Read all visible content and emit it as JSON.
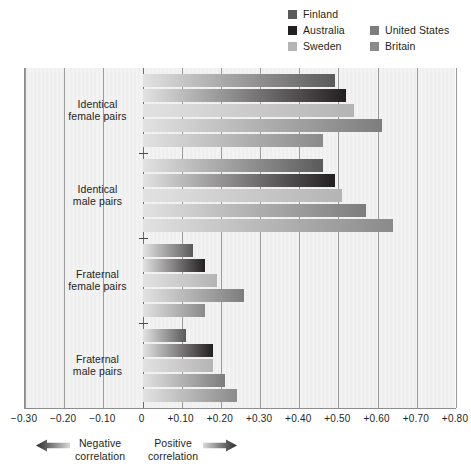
{
  "legend": {
    "columns": [
      [
        {
          "label": "Finland",
          "color": "#5a5a5a",
          "swatch": "legend-swatch-finland"
        },
        {
          "label": "Australia",
          "color": "#231f20",
          "swatch": "legend-swatch-australia"
        },
        {
          "label": "Sweden",
          "color": "#b4b4b4",
          "swatch": "legend-swatch-sweden"
        }
      ],
      [
        {
          "label": "United States",
          "color": "#7d7d7d",
          "swatch": "legend-swatch-united-states"
        },
        {
          "label": "Britain",
          "color": "#8a8a8a",
          "swatch": "legend-swatch-britain"
        }
      ]
    ]
  },
  "footer": {
    "negative": "Negative\ncorrelation",
    "negative_line1": "Negative",
    "negative_line2": "correlation",
    "positive_line1": "Positive",
    "positive_line2": "correlation",
    "arrow_left_icon": "arrow-left-icon",
    "arrow_right_icon": "arrow-right-icon"
  },
  "chart_data": {
    "type": "bar",
    "orientation": "horizontal",
    "title": "",
    "xlabel": "",
    "ylabel": "",
    "xlim": [
      -0.3,
      0.8
    ],
    "xticks": [
      -0.3,
      -0.2,
      -0.1,
      0,
      0.1,
      0.2,
      0.3,
      0.4,
      0.5,
      0.6,
      0.7,
      0.8
    ],
    "xticklabels": [
      "−0.30",
      "−0.20",
      "−0.10",
      "0",
      "+0.10",
      "+0.20",
      "+0.30",
      "+0.40",
      "+0.50",
      "+0.60",
      "+0.70",
      "+0.80"
    ],
    "grid": true,
    "legend_position": "top-right",
    "categories": [
      "Identical\nfemale pairs",
      "Identical\nmale pairs",
      "Fraternal\nfemale pairs",
      "Fraternal\nmale pairs"
    ],
    "category_lines": [
      [
        "Identical",
        "female pairs"
      ],
      [
        "Identical",
        "male pairs"
      ],
      [
        "Fraternal",
        "female pairs"
      ],
      [
        "Fraternal",
        "male pairs"
      ]
    ],
    "series": [
      {
        "name": "Finland",
        "color": "#5a5a5a",
        "values": [
          0.49,
          0.46,
          0.13,
          0.11
        ]
      },
      {
        "name": "Australia",
        "color": "#231f20",
        "values": [
          0.52,
          0.49,
          0.16,
          0.18
        ]
      },
      {
        "name": "Sweden",
        "color": "#b4b4b4",
        "values": [
          0.54,
          0.51,
          0.19,
          0.18
        ]
      },
      {
        "name": "United States",
        "color": "#7d7d7d",
        "values": [
          0.61,
          0.57,
          0.26,
          0.21
        ]
      },
      {
        "name": "Britain",
        "color": "#8a8a8a",
        "values": [
          0.46,
          0.64,
          0.16,
          0.24
        ]
      }
    ]
  }
}
